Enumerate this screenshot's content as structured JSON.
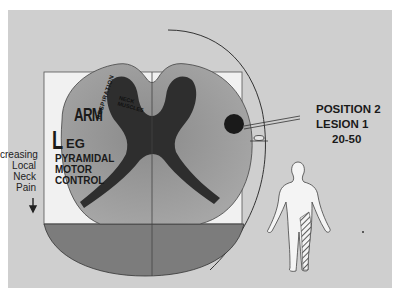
{
  "figure": {
    "type": "spinal cord cross-section diagram",
    "side_label": [
      "creasing",
      "Local",
      "Neck",
      "Pain"
    ],
    "side_arrow": "down-arrow",
    "somatotopy_labels": {
      "leg": "LEG",
      "leg_big": "L",
      "leg_small": "EG",
      "arm": "ARM",
      "respiration": "RESPIRATION",
      "neck_muscles": [
        "NECK",
        "MUSCLES"
      ]
    },
    "tract_label": [
      "PYRAMIDAL",
      "MOTOR",
      "CONTROL"
    ],
    "position_info": {
      "position": "POSITION 2",
      "lesion": "LESION 1",
      "ratio": "20-50"
    },
    "body_figure": {
      "shaded_region": "right leg (hatched)"
    },
    "colors": {
      "background": "#cfcfcf",
      "gray_matter": "#2e2e2e",
      "white_matter": "#9a9a9a",
      "lower_segment": "#7c7c7c",
      "lesion": "#1a1a1a"
    }
  }
}
